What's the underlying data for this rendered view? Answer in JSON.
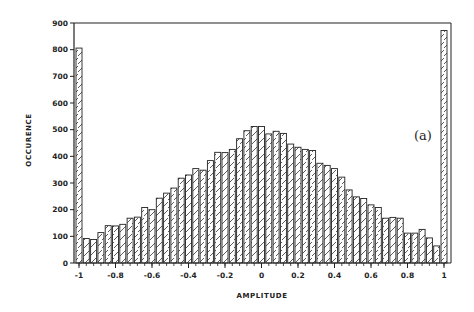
{
  "chart_data": {
    "type": "bar",
    "title": "",
    "panel_label": "(a)",
    "xlabel": "AMPLITUDE",
    "ylabel": "OCCURENCE",
    "xlim": [
      -1,
      1
    ],
    "ylim": [
      0,
      900
    ],
    "grid": false,
    "legend": null,
    "x_ticks": [
      -1,
      -0.8,
      -0.6,
      -0.4,
      -0.2,
      0,
      0.2,
      0.4,
      0.6,
      0.8,
      1
    ],
    "x_tick_labels": [
      "-1",
      "-0.8",
      "-0.6",
      "-0.4",
      "-0.2",
      "0",
      "0.2",
      "0.4",
      "0.6",
      "0.8",
      "1"
    ],
    "y_ticks": [
      0,
      100,
      200,
      300,
      400,
      500,
      600,
      700,
      800,
      900
    ],
    "y_tick_labels": [
      "0",
      "100",
      "200",
      "300",
      "400",
      "500",
      "600",
      "700",
      "800",
      "900"
    ],
    "bin_width": 0.04,
    "bar_fill": "hatched",
    "x": [
      -1.0,
      -0.96,
      -0.92,
      -0.88,
      -0.84,
      -0.8,
      -0.76,
      -0.72,
      -0.68,
      -0.64,
      -0.6,
      -0.56,
      -0.52,
      -0.48,
      -0.44,
      -0.4,
      -0.36,
      -0.32,
      -0.28,
      -0.24,
      -0.2,
      -0.16,
      -0.12,
      -0.08,
      -0.04,
      0.0,
      0.04,
      0.08,
      0.12,
      0.16,
      0.2,
      0.24,
      0.28,
      0.32,
      0.36,
      0.4,
      0.44,
      0.48,
      0.52,
      0.56,
      0.6,
      0.64,
      0.68,
      0.72,
      0.76,
      0.8,
      0.84,
      0.88,
      0.92,
      0.96,
      1.0
    ],
    "values": [
      806,
      92,
      88,
      114,
      140,
      139,
      145,
      168,
      172,
      208,
      200,
      243,
      262,
      281,
      318,
      330,
      354,
      348,
      384,
      415,
      414,
      426,
      466,
      496,
      512,
      512,
      484,
      494,
      486,
      446,
      434,
      426,
      422,
      374,
      366,
      354,
      322,
      274,
      248,
      242,
      218,
      208,
      168,
      171,
      168,
      112,
      112,
      126,
      94,
      64,
      872
    ]
  }
}
